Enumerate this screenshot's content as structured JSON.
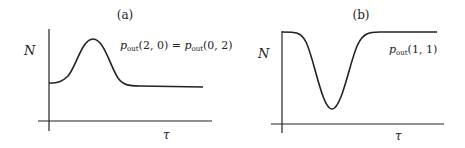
{
  "panels": [
    {
      "label": "(a)",
      "y_axis_label": "N",
      "x_axis_label": "τ",
      "annotation": {
        "lhs_base": "p",
        "lhs_sub": "out",
        "lhs_args": "(2, 0)",
        "eq": " = ",
        "rhs_base": "p",
        "rhs_sub": "out",
        "rhs_args": "(0, 2)"
      },
      "curve": "peak"
    },
    {
      "label": "(b)",
      "y_axis_label": "N",
      "x_axis_label": "τ",
      "annotation": {
        "base": "p",
        "sub": "out",
        "args": "(1, 1)"
      },
      "curve": "dip"
    }
  ],
  "colors": {
    "line": "#222222",
    "background": "#ffffff"
  }
}
